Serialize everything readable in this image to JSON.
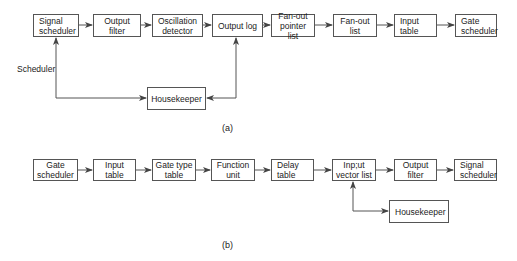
{
  "diagram_a": {
    "caption": "(a)",
    "boxes": [
      {
        "id": "signal-scheduler",
        "label": "Signal scheduler",
        "x": 33,
        "y": 14,
        "w": 46,
        "h": 23
      },
      {
        "id": "output-filter",
        "label": "Output filter",
        "x": 93,
        "y": 14,
        "w": 48,
        "h": 23
      },
      {
        "id": "oscillation-detector",
        "label": "Oscillation detector",
        "x": 152,
        "y": 14,
        "w": 51,
        "h": 23
      },
      {
        "id": "output-log",
        "label": "Output log",
        "x": 212,
        "y": 14,
        "w": 51,
        "h": 23
      },
      {
        "id": "fan-out-pointer-list",
        "label": "Fan-out pointer list",
        "x": 271,
        "y": 14,
        "w": 44,
        "h": 23
      },
      {
        "id": "fan-out-list",
        "label": "Fan-out list",
        "x": 333,
        "y": 14,
        "w": 44,
        "h": 23
      },
      {
        "id": "input-table",
        "label": "Input table",
        "x": 394,
        "y": 14,
        "w": 43,
        "h": 23
      },
      {
        "id": "gate-scheduler",
        "label": "Gate scheduler",
        "x": 455,
        "y": 14,
        "w": 42,
        "h": 23
      },
      {
        "id": "housekeeper",
        "label": "Housekeeper",
        "x": 147,
        "y": 87,
        "w": 59,
        "h": 23
      }
    ],
    "side_label": "Scheduler"
  },
  "diagram_b": {
    "caption": "(b)",
    "boxes": [
      {
        "id": "gate-scheduler",
        "label": "Gate scheduler",
        "x": 33,
        "y": 159,
        "w": 45,
        "h": 22
      },
      {
        "id": "input-table",
        "label": "Input table",
        "x": 93,
        "y": 159,
        "w": 43,
        "h": 22
      },
      {
        "id": "gate-type-table",
        "label": "Gate type table",
        "x": 152,
        "y": 159,
        "w": 44,
        "h": 22
      },
      {
        "id": "function-unit",
        "label": "Function unit",
        "x": 211,
        "y": 159,
        "w": 44,
        "h": 22
      },
      {
        "id": "delay-table",
        "label": "Delay table",
        "x": 271,
        "y": 159,
        "w": 43,
        "h": 22
      },
      {
        "id": "input-vector-list",
        "label": "Inp;ut vector list",
        "x": 332,
        "y": 159,
        "w": 44,
        "h": 22
      },
      {
        "id": "output-filter",
        "label": "Output filter",
        "x": 394,
        "y": 159,
        "w": 43,
        "h": 22
      },
      {
        "id": "signal-scheduler",
        "label": "Signal scheduler",
        "x": 454,
        "y": 159,
        "w": 43,
        "h": 22
      },
      {
        "id": "housekeeper",
        "label": "Housekeeper",
        "x": 389,
        "y": 200,
        "w": 60,
        "h": 23
      }
    ]
  },
  "colors": {
    "line": "#555555",
    "text": "#222222",
    "background": "#ffffff"
  }
}
